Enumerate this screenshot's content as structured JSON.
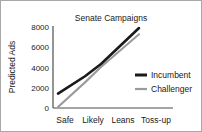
{
  "chart_data": {
    "type": "line",
    "title": "Senate Campaigns",
    "xlabel": "",
    "ylabel": "Predicted Ads",
    "categories": [
      "Safe",
      "Likely",
      "Leans",
      "Toss-up"
    ],
    "series": [
      {
        "name": "Incumbent",
        "color": "#1a1a1a",
        "values": [
          1400,
          3100,
          4300,
          7800
        ]
      },
      {
        "name": "Challenger",
        "color": "#9a9a9a",
        "values": [
          100,
          2500,
          4000,
          7200
        ]
      }
    ],
    "ylim": [
      0,
      8000
    ],
    "yticks": [
      0,
      2000,
      4000,
      6000,
      8000
    ],
    "ytick_labels": [
      "0",
      "2000",
      "4000",
      "6000",
      "8000"
    ],
    "grid": false,
    "legend_position": "center-right"
  },
  "legend": {
    "incumbent_label": "Incumbent",
    "challenger_label": "Challenger"
  },
  "axis": {
    "y_title": "Predicted Ads",
    "tick_0": "0",
    "tick_2000": "2000",
    "tick_4000": "4000",
    "tick_6000": "6000",
    "tick_8000": "8000",
    "x_safe": "Safe",
    "x_likely": "Likely",
    "x_leans": "Leans",
    "x_tossup": "Toss-up"
  },
  "header": {
    "title": "Senate Campaigns"
  }
}
